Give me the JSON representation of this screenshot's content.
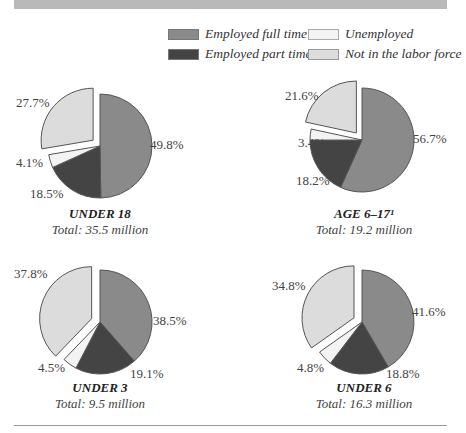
{
  "legend": [
    {
      "label": "Employed full time",
      "color": "#8a8a8a"
    },
    {
      "label": "Unemployed",
      "color": "#f3f3f3"
    },
    {
      "label": "Employed part time",
      "color": "#444444"
    },
    {
      "label": "Not in the labor force",
      "color": "#dcdcdc"
    }
  ],
  "charts": [
    {
      "title": "UNDER 18",
      "total": "Total:  35.5 million",
      "labels": {
        "full": "49.8%",
        "part": "18.5%",
        "unemp": "4.1%",
        "nilf": "27.7%"
      }
    },
    {
      "title": "AGE 6–17¹",
      "total": "Total:  19.2 million",
      "labels": {
        "full": "56.7%",
        "part": "18.2%",
        "unemp": "3.4%",
        "nilf": "21.6%"
      }
    },
    {
      "title": "UNDER 3",
      "total": "Total:  9.5 million",
      "labels": {
        "full": "38.5%",
        "part": "19.1%",
        "unemp": "4.5%",
        "nilf": "37.8%"
      }
    },
    {
      "title": "UNDER 6",
      "total": "Total:  16.3 million",
      "labels": {
        "full": "41.6%",
        "part": "18.8%",
        "unemp": "4.8%",
        "nilf": "34.8%"
      }
    }
  ],
  "chart_data": [
    {
      "type": "pie",
      "title": "UNDER 18",
      "subtitle": "Total: 35.5 million",
      "categories": [
        "Employed full time",
        "Employed part time",
        "Unemployed",
        "Not in the labor force"
      ],
      "values": [
        49.8,
        18.5,
        4.1,
        27.7
      ],
      "exploded": "Not in the labor force",
      "legend_position": "top-right"
    },
    {
      "type": "pie",
      "title": "AGE 6–17¹",
      "subtitle": "Total: 19.2 million",
      "categories": [
        "Employed full time",
        "Employed part time",
        "Unemployed",
        "Not in the labor force"
      ],
      "values": [
        56.7,
        18.2,
        3.4,
        21.6
      ],
      "exploded": "Not in the labor force"
    },
    {
      "type": "pie",
      "title": "UNDER 3",
      "subtitle": "Total: 9.5 million",
      "categories": [
        "Employed full time",
        "Employed part time",
        "Unemployed",
        "Not in the labor force"
      ],
      "values": [
        38.5,
        19.1,
        4.5,
        37.8
      ],
      "exploded": "Not in the labor force"
    },
    {
      "type": "pie",
      "title": "UNDER 6",
      "subtitle": "Total: 16.3 million",
      "categories": [
        "Employed full time",
        "Employed part time",
        "Unemployed",
        "Not in the labor force"
      ],
      "values": [
        41.6,
        18.8,
        4.8,
        34.8
      ],
      "exploded": "Not in the labor force"
    }
  ]
}
